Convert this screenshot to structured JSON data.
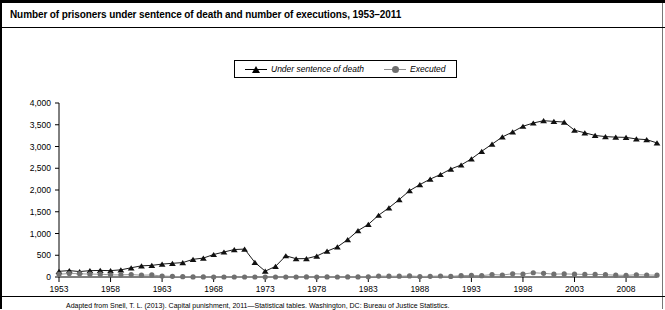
{
  "header": {
    "title": "Number of prisoners under sentence of death and number of executions, 1953–2011"
  },
  "legend": {
    "position": "top-center",
    "entries": [
      {
        "label": "Under sentence of death",
        "marker": "triangle-marker-icon",
        "color": "#111111"
      },
      {
        "label": "Executed",
        "marker": "circle-marker-icon",
        "color": "#707070"
      }
    ]
  },
  "footnote": {
    "text": "Adapted from Snell, T. L. (2013). Capital punishment, 2011—Statistical tables. Washington, DC: Bureau of Justice Statistics."
  },
  "chart_data": {
    "type": "line",
    "title": "Number of prisoners under sentence of death and number of executions, 1953–2011",
    "xlabel": "",
    "ylabel": "",
    "grid": false,
    "legend_position": "top-center",
    "xlim": [
      1953,
      2011
    ],
    "ylim": [
      0,
      4000
    ],
    "yticks": [
      0,
      500,
      1000,
      1500,
      2000,
      2500,
      3000,
      3500,
      4000
    ],
    "ytick_labels": [
      "0",
      "500",
      "1,000",
      "1,500",
      "2,000",
      "2,500",
      "3,000",
      "3,500",
      "4,000"
    ],
    "xticks": [
      1953,
      1958,
      1963,
      1968,
      1973,
      1978,
      1983,
      1988,
      1993,
      1998,
      2003,
      2008
    ],
    "xtick_labels": [
      "1953",
      "1958",
      "1963",
      "1968",
      "1973",
      "1978",
      "1983",
      "1988",
      "1993",
      "1998",
      "2003",
      "2008"
    ],
    "x": [
      1953,
      1954,
      1955,
      1956,
      1957,
      1958,
      1959,
      1960,
      1961,
      1962,
      1963,
      1964,
      1965,
      1966,
      1967,
      1968,
      1969,
      1970,
      1971,
      1972,
      1973,
      1974,
      1975,
      1976,
      1977,
      1978,
      1979,
      1980,
      1981,
      1982,
      1983,
      1984,
      1985,
      1986,
      1987,
      1988,
      1989,
      1990,
      1991,
      1992,
      1993,
      1994,
      1995,
      1996,
      1997,
      1998,
      1999,
      2000,
      2001,
      2002,
      2003,
      2004,
      2005,
      2006,
      2007,
      2008,
      2009,
      2010,
      2011
    ],
    "series": [
      {
        "name": "Under sentence of death",
        "marker": "triangle",
        "color": "#111111",
        "values": [
          131,
          147,
          125,
          146,
          151,
          147,
          164,
          212,
          257,
          267,
          297,
          315,
          331,
          406,
          435,
          517,
          575,
          631,
          642,
          334,
          134,
          244,
          488,
          420,
          423,
          482,
          593,
          691,
          860,
          1066,
          1209,
          1420,
          1591,
          1781,
          1984,
          2124,
          2250,
          2356,
          2482,
          2575,
          2716,
          2890,
          3054,
          3219,
          3335,
          3465,
          3540,
          3593,
          3577,
          3562,
          3374,
          3315,
          3254,
          3228,
          3215,
          3210,
          3173,
          3158,
          3082
        ]
      },
      {
        "name": "Executed",
        "marker": "circle",
        "color": "#707070",
        "values": [
          62,
          81,
          76,
          65,
          65,
          49,
          49,
          56,
          42,
          47,
          21,
          15,
          7,
          1,
          2,
          0,
          0,
          0,
          0,
          0,
          0,
          0,
          0,
          0,
          1,
          0,
          2,
          0,
          1,
          2,
          5,
          21,
          18,
          18,
          25,
          11,
          16,
          23,
          14,
          31,
          38,
          31,
          56,
          45,
          74,
          68,
          98,
          85,
          66,
          71,
          65,
          59,
          60,
          53,
          42,
          37,
          52,
          46,
          43
        ]
      }
    ]
  }
}
